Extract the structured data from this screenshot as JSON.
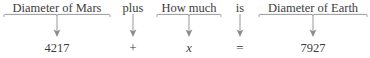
{
  "diagram": {
    "kind": "word-problem-translation",
    "line_color": "#8d8d8d",
    "text_color": "#3c3c3c",
    "background": "#ffffff",
    "columns": [
      {
        "id": "diameter-of-mars",
        "phrase": "Diameter of Mars",
        "term": "4217",
        "term_kind": "number",
        "connector": "underbrace-arrow",
        "left": 2,
        "width": 110
      },
      {
        "id": "plus",
        "phrase": "plus",
        "term": "+",
        "term_kind": "operator",
        "connector": "plain-arrow",
        "left": 112,
        "width": 42
      },
      {
        "id": "how-much",
        "phrase": "How much",
        "term": "x",
        "term_kind": "variable",
        "connector": "underbrace-arrow",
        "left": 155,
        "width": 68
      },
      {
        "id": "is",
        "phrase": "is",
        "term": "=",
        "term_kind": "operator",
        "connector": "plain-arrow",
        "left": 223,
        "width": 34
      },
      {
        "id": "diameter-of-earth",
        "phrase": "Diameter of Earth",
        "term": "7927",
        "term_kind": "number",
        "connector": "underbrace-arrow",
        "left": 257,
        "width": 112
      }
    ],
    "sentence": "Diameter of Mars plus How much is Diameter of Earth",
    "equation": "4217 + x = 7927"
  }
}
